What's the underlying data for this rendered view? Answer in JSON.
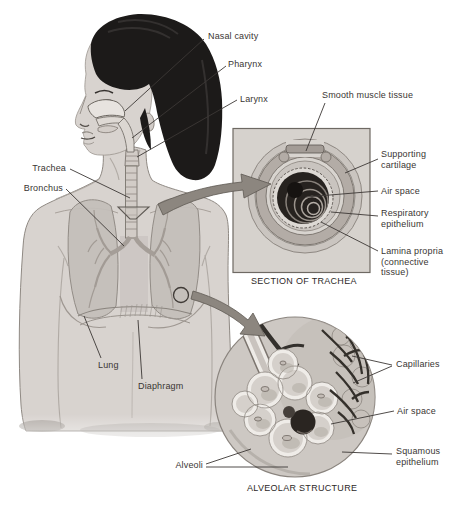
{
  "diagram": {
    "type": "anatomical-illustration",
    "body_labels": {
      "nasal_cavity": "Nasal cavity",
      "pharynx": "Pharynx",
      "larynx": "Larynx",
      "trachea": "Trachea",
      "bronchus": "Bronchus",
      "lung": "Lung",
      "diaphragm": "Diaphragm",
      "alveoli": "Alveoli"
    },
    "trachea_inset": {
      "caption": "SECTION OF TRACHEA",
      "labels": {
        "smooth_muscle": "Smooth muscle tissue",
        "supporting_cartilage": "Supporting cartilage",
        "air_space": "Air space",
        "respiratory_epithelium": "Respiratory epithelium",
        "lamina_propria": "Lamina propria (connective tissue)"
      }
    },
    "alveolar_inset": {
      "caption": "ALVEOLAR STRUCTURE",
      "labels": {
        "capillaries": "Capillaries",
        "air_space": "Air space",
        "squamous_epithelium": "Squamous epithelium"
      }
    },
    "colors": {
      "background": "#ffffff",
      "skin": "#d8d3cf",
      "hair": "#1c1a19",
      "lung": "#c4bfba",
      "inset_box": "#d6d2cd",
      "air_space_dark": "#26221f",
      "arrow": "#8c867f",
      "leader_line": "#3c3835",
      "label_text": "#3a3633"
    }
  }
}
